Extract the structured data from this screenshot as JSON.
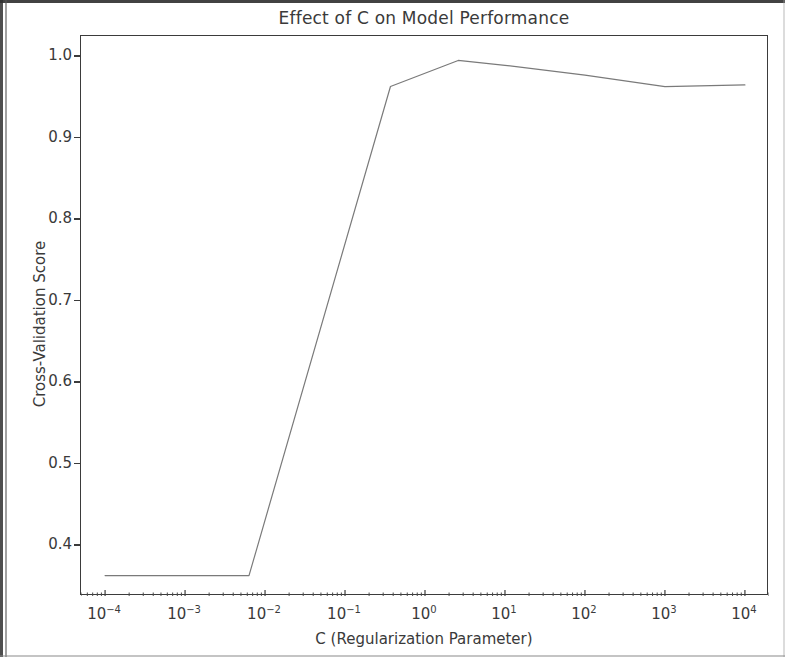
{
  "chart_data": {
    "type": "line",
    "title": "Effect of C on Model Performance",
    "xlabel": "C (Regularization Parameter)",
    "ylabel": "Cross-Validation Score",
    "xscale": "log",
    "yscale": "linear",
    "xlim": [
      5e-05,
      20000
    ],
    "ylim": [
      0.338,
      1.025
    ],
    "grid": false,
    "legend": null,
    "line_color": "#7a7a7a",
    "line_width": 1.2,
    "x": [
      0.0001,
      0.001,
      0.0063,
      0.37,
      2.6,
      10,
      100,
      1000,
      10000
    ],
    "y": [
      0.363,
      0.363,
      0.363,
      0.963,
      0.995,
      0.989,
      0.977,
      0.963,
      0.965
    ],
    "series": [
      {
        "name": "Cross-Validation Score",
        "values": [
          0.363,
          0.363,
          0.363,
          0.963,
          0.995,
          0.989,
          0.977,
          0.963,
          0.965
        ]
      }
    ],
    "xticks": [
      {
        "value": 0.0001,
        "label_base": "10",
        "label_exp": "−4"
      },
      {
        "value": 0.001,
        "label_base": "10",
        "label_exp": "−3"
      },
      {
        "value": 0.01,
        "label_base": "10",
        "label_exp": "−2"
      },
      {
        "value": 0.1,
        "label_base": "10",
        "label_exp": "−1"
      },
      {
        "value": 1,
        "label_base": "10",
        "label_exp": "0"
      },
      {
        "value": 10,
        "label_base": "10",
        "label_exp": "1"
      },
      {
        "value": 100,
        "label_base": "10",
        "label_exp": "2"
      },
      {
        "value": 1000,
        "label_base": "10",
        "label_exp": "3"
      },
      {
        "value": 10000,
        "label_base": "10",
        "label_exp": "4"
      }
    ],
    "yticks": [
      {
        "value": 1.0,
        "label": "1.0"
      },
      {
        "value": 0.9,
        "label": "0.9"
      },
      {
        "value": 0.8,
        "label": "0.8"
      },
      {
        "value": 0.7,
        "label": "0.7"
      },
      {
        "value": 0.6,
        "label": "0.6"
      },
      {
        "value": 0.5,
        "label": "0.5"
      },
      {
        "value": 0.4,
        "label": "0.4"
      }
    ]
  }
}
